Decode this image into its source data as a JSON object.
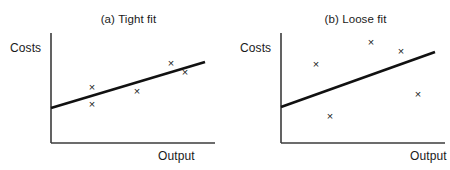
{
  "figure": {
    "panels": [
      {
        "id": "a",
        "title": "(a) Tight fit",
        "y_axis_label": "Costs",
        "x_axis_label": "Output",
        "marker_glyph": "×"
      },
      {
        "id": "b",
        "title": "(b) Loose fit",
        "y_axis_label": "Costs",
        "x_axis_label": "Output",
        "marker_glyph": "×"
      }
    ],
    "colors": {
      "axis": "#3b3b3b",
      "trend_line": "#111111",
      "marker": "#1a1a1a",
      "background": "#ffffff"
    }
  },
  "chart_data": [
    {
      "type": "scatter",
      "title": "(a) Tight fit",
      "xlabel": "Output",
      "ylabel": "Costs",
      "grid": false,
      "legend": "none",
      "axis_pixel_frame": {
        "x0": 51,
        "y0": 143,
        "x_right": 215,
        "y_top": 33
      },
      "xlim": [
        0,
        10
      ],
      "ylim": [
        0,
        10
      ],
      "points": [
        {
          "x": 2.5,
          "y": 5.1
        },
        {
          "x": 2.5,
          "y": 3.5
        },
        {
          "x": 5.2,
          "y": 4.7
        },
        {
          "x": 7.3,
          "y": 7.3
        },
        {
          "x": 8.2,
          "y": 6.5
        }
      ],
      "points_pixels": [
        {
          "x": 92,
          "y": 87
        },
        {
          "x": 92,
          "y": 104
        },
        {
          "x": 137,
          "y": 91
        },
        {
          "x": 171,
          "y": 63
        },
        {
          "x": 185,
          "y": 72
        }
      ],
      "trend_line": {
        "label": "regression line",
        "x_start": 0,
        "y_start": 3.2,
        "x_end": 9.4,
        "y_end": 7.4,
        "pixel_start": {
          "x": 51,
          "y": 108
        },
        "pixel_end": {
          "x": 205,
          "y": 62
        },
        "width_px": 2.6
      },
      "scatter_note": "points lie close to the fitted line"
    },
    {
      "type": "scatter",
      "title": "(b) Loose fit",
      "xlabel": "Output",
      "ylabel": "Costs",
      "grid": false,
      "legend": "none",
      "axis_pixel_frame": {
        "x0": 281,
        "y0": 143,
        "x_right": 445,
        "y_top": 33
      },
      "xlim": [
        0,
        10
      ],
      "ylim": [
        0,
        10
      ],
      "points": [
        {
          "x": 2.1,
          "y": 7.2
        },
        {
          "x": 5.5,
          "y": 9.2
        },
        {
          "x": 7.3,
          "y": 8.4
        },
        {
          "x": 8.4,
          "y": 4.5
        },
        {
          "x": 3.0,
          "y": 2.5
        }
      ],
      "points_pixels": [
        {
          "x": 316,
          "y": 64
        },
        {
          "x": 371,
          "y": 42
        },
        {
          "x": 401,
          "y": 51
        },
        {
          "x": 418,
          "y": 94
        },
        {
          "x": 330,
          "y": 116
        }
      ],
      "trend_line": {
        "label": "regression line",
        "x_start": 0,
        "y_start": 3.3,
        "x_end": 9.4,
        "y_end": 8.3,
        "pixel_start": {
          "x": 281,
          "y": 107
        },
        "pixel_end": {
          "x": 435,
          "y": 52
        },
        "width_px": 2.6
      },
      "scatter_note": "points scatter widely around the fitted line"
    }
  ]
}
